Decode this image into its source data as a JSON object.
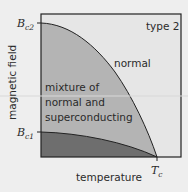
{
  "diagram": {
    "title_label": "type 2",
    "x_axis_label": "temperature",
    "y_axis_label": "magnetic field",
    "y_ticks": [
      {
        "symbol": "B",
        "subscript": "c2"
      },
      {
        "symbol": "B",
        "subscript": "c1"
      }
    ],
    "x_ticks": [
      {
        "symbol": "T",
        "subscript": "c"
      }
    ],
    "regions": {
      "normal": "normal",
      "mixed_line1": "mixture of",
      "mixed_line2": "normal and",
      "mixed_line3": "superconducting"
    },
    "colors": {
      "background": "#eeeeee",
      "normal_region": "#e6e6e6",
      "mixed_region": "#b4b4b4",
      "superconducting_region": "#6e6e6e",
      "border": "#222222"
    }
  }
}
